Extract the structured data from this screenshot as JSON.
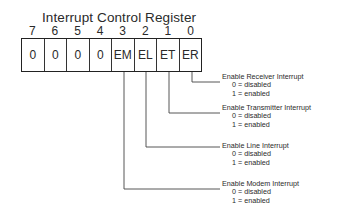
{
  "diagram": {
    "title": "Interrupt Control Register",
    "bits": [
      {
        "number": "7",
        "value": "0"
      },
      {
        "number": "6",
        "value": "0"
      },
      {
        "number": "5",
        "value": "0"
      },
      {
        "number": "4",
        "value": "0"
      },
      {
        "number": "3",
        "value": "EM"
      },
      {
        "number": "2",
        "value": "EL"
      },
      {
        "number": "1",
        "value": "ET"
      },
      {
        "number": "0",
        "value": "ER"
      }
    ],
    "descriptions": [
      {
        "bit": "ER",
        "label": "Enable Receiver Interrupt",
        "opt0": "0 = disabled",
        "opt1": "1 = enabled"
      },
      {
        "bit": "ET",
        "label": "Enable Transmitter Interrupt",
        "opt0": "0 = disabled",
        "opt1": "1 = enabled"
      },
      {
        "bit": "EL",
        "label": "Enable Line Interrupt",
        "opt0": "0 = disabled",
        "opt1": "1 = enabled"
      },
      {
        "bit": "EM",
        "label": "Enable Modem Interrupt",
        "opt0": "0 = disabled",
        "opt1": "1 = enabled"
      }
    ]
  }
}
